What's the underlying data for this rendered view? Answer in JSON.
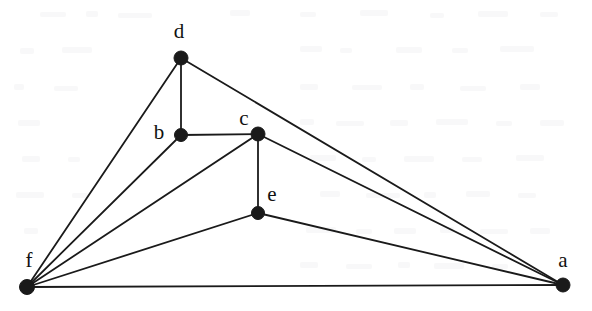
{
  "figure": {
    "width": 592,
    "height": 311,
    "background_color": "#ffffff",
    "ink_color": "#1a1a1a",
    "edge_stroke_width": 1.8,
    "vertex_radius": 6.5
  },
  "chart_data": {
    "type": "diagram",
    "subtype": "node-link-graph",
    "directed": false,
    "title": "",
    "node_count": 6,
    "edge_count": 11,
    "nodes": [
      {
        "id": "a",
        "label": "a",
        "x": 563,
        "y": 285,
        "r": 7,
        "label_x": 563,
        "label_y": 262,
        "degree": 4
      },
      {
        "id": "b",
        "label": "b",
        "x": 181,
        "y": 135,
        "r": 6.5,
        "label_x": 159,
        "label_y": 134,
        "degree": 3
      },
      {
        "id": "c",
        "label": "c",
        "x": 258,
        "y": 134,
        "r": 7,
        "label_x": 244,
        "label_y": 120,
        "degree": 4
      },
      {
        "id": "d",
        "label": "d",
        "x": 181,
        "y": 58,
        "r": 7,
        "label_x": 179,
        "label_y": 33,
        "degree": 3
      },
      {
        "id": "e",
        "label": "e",
        "x": 258,
        "y": 213,
        "r": 6.5,
        "label_x": 272,
        "label_y": 196,
        "degree": 3
      },
      {
        "id": "f",
        "label": "f",
        "x": 27,
        "y": 287,
        "r": 7.5,
        "label_x": 29,
        "label_y": 262,
        "degree": 5
      }
    ],
    "edges": [
      {
        "source": "d",
        "target": "b"
      },
      {
        "source": "d",
        "target": "f"
      },
      {
        "source": "d",
        "target": "a"
      },
      {
        "source": "b",
        "target": "c"
      },
      {
        "source": "b",
        "target": "f"
      },
      {
        "source": "c",
        "target": "e"
      },
      {
        "source": "c",
        "target": "f"
      },
      {
        "source": "c",
        "target": "a"
      },
      {
        "source": "e",
        "target": "f"
      },
      {
        "source": "e",
        "target": "a"
      },
      {
        "source": "f",
        "target": "a"
      }
    ],
    "adjacency": {
      "a": [
        "c",
        "d",
        "e",
        "f"
      ],
      "b": [
        "c",
        "d",
        "f"
      ],
      "c": [
        "a",
        "b",
        "e",
        "f"
      ],
      "d": [
        "a",
        "b",
        "f"
      ],
      "e": [
        "a",
        "c",
        "f"
      ],
      "f": [
        "a",
        "b",
        "c",
        "d",
        "e"
      ]
    }
  }
}
